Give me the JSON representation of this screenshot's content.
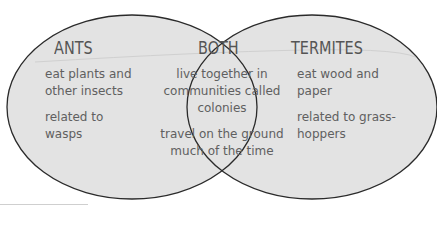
{
  "diagram": {
    "type": "venn",
    "colors": {
      "fill": "#e2e2e2",
      "stroke": "#2a2a2a",
      "text": "#5c5c5c"
    },
    "sets": [
      {
        "name": "ANTS",
        "items": [
          "eat plants and other insects",
          "related to wasps"
        ]
      },
      {
        "name": "TERMITES",
        "items": [
          "eat wood and paper",
          "related to grass-hoppers"
        ]
      }
    ],
    "intersection": {
      "name": "BOTH",
      "items": [
        "live together in communities called colonies",
        "travel on the ground much of the time"
      ]
    }
  },
  "ants": {
    "title": "ANTS",
    "item1_line1": "eat plants and",
    "item1_line2": "other insects",
    "item2_line1": "related to",
    "item2_line2": "wasps"
  },
  "both": {
    "title": "BOTH",
    "item1_line1": "live together in",
    "item1_line2": "communities called",
    "item1_line3": "colonies",
    "item2_line1": "travel on the ground",
    "item2_line2": "much of the time"
  },
  "termites": {
    "title": "TERMITES",
    "item1_line1": "eat wood and",
    "item1_line2": "paper",
    "item2_line1": "related to grass-",
    "item2_line2": "hoppers"
  }
}
